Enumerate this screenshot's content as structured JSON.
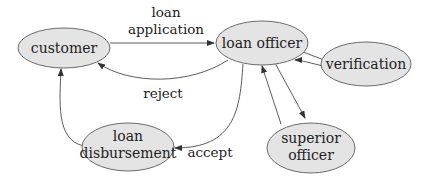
{
  "diagram": {
    "type": "workflow",
    "colors": {
      "node_fill": "#e4e4e4",
      "node_stroke": "#6a6a6a",
      "edge": "#4a4a4a",
      "text": "#222222"
    },
    "nodes": {
      "customer": {
        "label": "customer"
      },
      "loan_officer": {
        "label": "loan officer"
      },
      "verification": {
        "label": "verification"
      },
      "superior_officer": {
        "line1": "superior",
        "line2": "officer"
      },
      "loan_disbursement": {
        "line1": "loan",
        "line2": "disbursement"
      }
    },
    "edges": {
      "loan_application": {
        "line1": "loan",
        "line2": "application",
        "from": "customer",
        "to": "loan officer"
      },
      "reject": {
        "label": "reject",
        "from": "loan officer",
        "to": "customer"
      },
      "accept": {
        "label": "accept",
        "from": "loan officer",
        "to": "loan disbursement"
      },
      "disburse": {
        "from": "loan disbursement",
        "to": "customer"
      },
      "to_verification": {
        "from": "loan officer",
        "to": "verification"
      },
      "from_verification": {
        "from": "verification",
        "to": "loan officer"
      },
      "to_superior": {
        "from": "loan officer",
        "to": "superior officer"
      },
      "from_superior": {
        "from": "superior officer",
        "to": "loan officer"
      }
    }
  }
}
